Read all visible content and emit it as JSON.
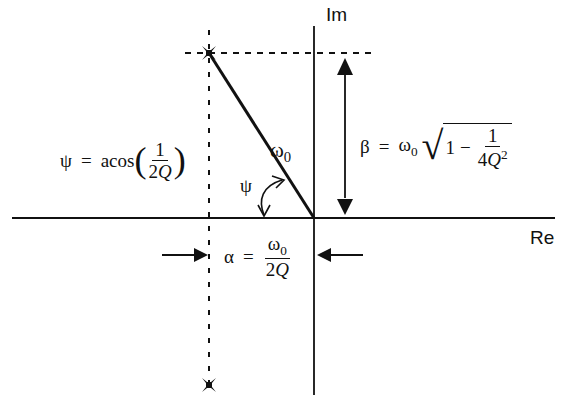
{
  "diagram": {
    "type": "s-plane pole diagram",
    "axes": {
      "imag_label": "Im",
      "real_label": "Re"
    },
    "poles": [
      {
        "name": "upper-pole",
        "x": 209,
        "y": 53
      },
      {
        "name": "lower-pole",
        "x": 209,
        "y": 385
      }
    ],
    "vector_label": {
      "symbol": "ω",
      "subscript": "0"
    },
    "angle_label": "ψ",
    "psi_equation": {
      "lhs": "ψ",
      "eq": "=",
      "func": "acos",
      "open": "(",
      "close": ")",
      "numerator": "1",
      "denominator_coef": "2",
      "denominator_var": "Q"
    },
    "beta_equation": {
      "lhs": "β",
      "eq": "=",
      "omega": "ω",
      "omega_sub": "0",
      "radical": "√",
      "one": "1",
      "minus": "−",
      "numerator": "1",
      "denominator_coef": "4",
      "denominator_var": "Q",
      "denominator_exp": "2"
    },
    "alpha_equation": {
      "lhs": "α",
      "eq": "=",
      "num_symbol": "ω",
      "num_sub": "0",
      "denominator_coef": "2",
      "denominator_var": "Q"
    },
    "colors": {
      "line": "#111111",
      "background": "#ffffff"
    }
  }
}
